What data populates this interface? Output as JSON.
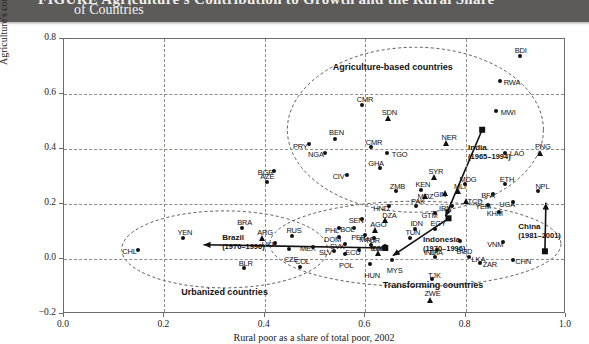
{
  "header": {
    "title_cut": "FIGURE  Agriculture's Contribution to Growth and the Rural Share",
    "title_line2": "of Countries"
  },
  "chart_data": {
    "type": "scatter",
    "title": "Agriculture's Contribution to Growth and the Rural Share of Countries",
    "xlabel": "Rural poor as a share of total poor, 2002",
    "ylabel": "Agriculture's contribution to growth, 1990–2005",
    "xlim": [
      0.0,
      1.0
    ],
    "ylim": [
      -0.2,
      0.8
    ],
    "xticks": [
      "0.0",
      "0.2",
      "0.4",
      "0.6",
      "0.8",
      "1.0"
    ],
    "ytick_values": [
      0.8,
      0.6,
      0.4,
      0.2,
      0.0,
      -0.2
    ],
    "yticks": [
      "0.8",
      "0.6",
      "0.4",
      "0.2",
      "0.0",
      "−0.2"
    ],
    "grid": true,
    "legend": "none",
    "group_labels": [
      {
        "text": "Agriculture-based countries",
        "x": 0.655,
        "y": 0.7
      },
      {
        "text": "Transforming countries",
        "x": 0.735,
        "y": -0.095
      },
      {
        "text": "Urbanized countries",
        "x": 0.32,
        "y": -0.12
      }
    ],
    "ellipses": [
      {
        "name": "agriculture-based-ellipse",
        "cx": 0.7,
        "cy": 0.47,
        "rx": 0.255,
        "ry": 0.3,
        "rot": 0
      },
      {
        "name": "transforming-ellipse",
        "cx": 0.7,
        "cy": 0.055,
        "rx": 0.29,
        "ry": 0.155,
        "rot": 0
      },
      {
        "name": "urbanized-ellipse",
        "cx": 0.32,
        "cy": 0.035,
        "rx": 0.205,
        "ry": 0.14,
        "rot": 0
      }
    ],
    "trajectories": [
      {
        "name": "India",
        "period": "(1965–1994)",
        "label_x": 0.805,
        "label_y": 0.405,
        "from": {
          "x": 0.76,
          "y": 0.155
        },
        "to": {
          "x": 0.833,
          "y": 0.47
        }
      },
      {
        "name": "Indonesia",
        "period": "(1970–1996)",
        "label_x": 0.715,
        "label_y": 0.07,
        "from": {
          "x": 0.655,
          "y": 0.012
        },
        "to": {
          "x": 0.766,
          "y": 0.148
        }
      },
      {
        "name": "China",
        "period": "(1981–2001)",
        "label_x": 0.905,
        "label_y": 0.115,
        "from": {
          "x": 0.96,
          "y": 0.205
        },
        "to": {
          "x": 0.958,
          "y": 0.028
        }
      },
      {
        "name": "Brazil",
        "period": "(1970–1996)",
        "label_x": 0.315,
        "label_y": 0.075,
        "from": {
          "x": 0.278,
          "y": 0.052
        },
        "to": {
          "x": 0.64,
          "y": 0.04
        }
      }
    ],
    "points": [
      {
        "code": "BDI",
        "x": 0.91,
        "y": 0.735,
        "marker": "circle",
        "lx": -6,
        "ly": -11
      },
      {
        "code": "RWA",
        "x": 0.87,
        "y": 0.645,
        "marker": "circle",
        "lx": 3,
        "ly": -4
      },
      {
        "code": "MWI",
        "x": 0.862,
        "y": 0.535,
        "marker": "circle",
        "lx": 4,
        "ly": -4
      },
      {
        "code": "SDN",
        "x": 0.645,
        "y": 0.51,
        "marker": "triangle",
        "lx": -6,
        "ly": -11
      },
      {
        "code": "CMR",
        "x": 0.595,
        "y": 0.56,
        "marker": "circle",
        "lx": -6,
        "ly": -10
      },
      {
        "code": "NER",
        "x": 0.76,
        "y": 0.42,
        "marker": "triangle",
        "lx": -4,
        "ly": -11
      },
      {
        "code": "PNG",
        "x": 0.948,
        "y": 0.385,
        "marker": "triangle",
        "lx": -5,
        "ly": -11
      },
      {
        "code": "LAO",
        "x": 0.88,
        "y": 0.385,
        "marker": "circle",
        "lx": 4,
        "ly": -4
      },
      {
        "code": "BEN",
        "x": 0.54,
        "y": 0.435,
        "marker": "circle",
        "lx": -6,
        "ly": -11
      },
      {
        "code": "PRY",
        "x": 0.49,
        "y": 0.415,
        "marker": "circle",
        "lx": -17,
        "ly": -3
      },
      {
        "code": "NGA",
        "x": 0.52,
        "y": 0.385,
        "marker": "circle",
        "lx": -17,
        "ly": -3
      },
      {
        "code": "CMR2",
        "code_label": "CMR",
        "x": 0.613,
        "y": 0.405,
        "marker": "circle",
        "lx": -6,
        "ly": -10
      },
      {
        "code": "TGO",
        "x": 0.645,
        "y": 0.385,
        "marker": "circle",
        "lx": 4,
        "ly": -3
      },
      {
        "code": "GHA",
        "x": 0.63,
        "y": 0.33,
        "marker": "circle",
        "lx": -12,
        "ly": -9
      },
      {
        "code": "CIV",
        "x": 0.565,
        "y": 0.305,
        "marker": "circle",
        "lx": -15,
        "ly": -3
      },
      {
        "code": "BGR",
        "x": 0.42,
        "y": 0.32,
        "marker": "circle",
        "lx": -17,
        "ly": -3
      },
      {
        "code": "AZE",
        "x": 0.405,
        "y": 0.28,
        "marker": "circle",
        "lx": -7,
        "ly": -10
      },
      {
        "code": "SYR",
        "x": 0.738,
        "y": 0.295,
        "marker": "triangle",
        "lx": -6,
        "ly": -11
      },
      {
        "code": "MDG",
        "x": 0.8,
        "y": 0.27,
        "marker": "circle",
        "lx": -6,
        "ly": -10
      },
      {
        "code": "ETH",
        "x": 0.88,
        "y": 0.27,
        "marker": "circle",
        "lx": -6,
        "ly": -10
      },
      {
        "code": "MLI",
        "x": 0.785,
        "y": 0.245,
        "marker": "triangle",
        "lx": -4,
        "ly": -10
      },
      {
        "code": "GIN",
        "x": 0.758,
        "y": 0.24,
        "marker": "triangle",
        "lx": -11,
        "ly": -3
      },
      {
        "code": "KEN",
        "x": 0.712,
        "y": 0.25,
        "marker": "circle",
        "lx": -6,
        "ly": -10
      },
      {
        "code": "ZMB",
        "x": 0.663,
        "y": 0.245,
        "marker": "circle",
        "lx": -7,
        "ly": -10
      },
      {
        "code": "MOZ",
        "x": 0.72,
        "y": 0.228,
        "marker": "triangle",
        "lx": -8,
        "ly": -4
      },
      {
        "code": "BFA",
        "x": 0.855,
        "y": 0.235,
        "marker": "circle",
        "lx": -12,
        "ly": -3
      },
      {
        "code": "NPL",
        "x": 0.945,
        "y": 0.245,
        "marker": "circle",
        "lx": -3,
        "ly": -10
      },
      {
        "code": "UGA",
        "x": 0.895,
        "y": 0.205,
        "marker": "circle",
        "lx": -14,
        "ly": -3
      },
      {
        "code": "TCD",
        "x": 0.8,
        "y": 0.21,
        "marker": "triangle",
        "lx": 2,
        "ly": -4
      },
      {
        "code": "YEM",
        "x": 0.845,
        "y": 0.195,
        "marker": "circle",
        "lx": -13,
        "ly": -3
      },
      {
        "code": "IRN",
        "x": 0.773,
        "y": 0.19,
        "marker": "circle",
        "lx": -13,
        "ly": -3
      },
      {
        "code": "PAK",
        "x": 0.703,
        "y": 0.19,
        "marker": "circle",
        "lx": -6,
        "ly": -10
      },
      {
        "code": "HND",
        "x": 0.648,
        "y": 0.19,
        "marker": "circle",
        "lx": -16,
        "ly": -3
      },
      {
        "code": "GTM",
        "x": 0.74,
        "y": 0.165,
        "marker": "circle",
        "lx": -14,
        "ly": -3
      },
      {
        "code": "KHM",
        "x": 0.868,
        "y": 0.17,
        "marker": "circle",
        "lx": -13,
        "ly": -3
      },
      {
        "code": "DZA",
        "x": 0.64,
        "y": 0.14,
        "marker": "triangle",
        "lx": -3,
        "ly": -10
      },
      {
        "code": "SEN",
        "x": 0.595,
        "y": 0.145,
        "marker": "circle",
        "lx": -14,
        "ly": -3
      },
      {
        "code": "AGO",
        "x": 0.62,
        "y": 0.105,
        "marker": "triangle",
        "lx": -5,
        "ly": -10
      },
      {
        "code": "IDN",
        "x": 0.7,
        "y": 0.108,
        "marker": "circle",
        "lx": -5,
        "ly": -10
      },
      {
        "code": "EGY",
        "x": 0.74,
        "y": 0.108,
        "marker": "circle",
        "lx": -5,
        "ly": -10
      },
      {
        "code": "MAR",
        "x": 0.618,
        "y": 0.075,
        "marker": "circle",
        "lx": -15,
        "ly": -3
      },
      {
        "code": "TUN",
        "x": 0.69,
        "y": 0.075,
        "marker": "circle",
        "lx": -5,
        "ly": -10
      },
      {
        "code": "ROM",
        "x": 0.64,
        "y": 0.045,
        "marker": "circle",
        "lx": -15,
        "ly": -3
      },
      {
        "code": "BGD",
        "x": 0.79,
        "y": 0.065,
        "marker": "circle",
        "lx": -4,
        "ly": 6
      },
      {
        "code": "VNM",
        "x": 0.875,
        "y": 0.06,
        "marker": "circle",
        "lx": -16,
        "ly": -3
      },
      {
        "code": "IND",
        "x": 0.745,
        "y": 0.03,
        "marker": "circle",
        "lx": -14,
        "ly": -3
      },
      {
        "code": "THA",
        "x": 0.74,
        "y": 0.005,
        "marker": "circle",
        "lx": -7,
        "ly": -10
      },
      {
        "code": "LKA",
        "x": 0.808,
        "y": 0.005,
        "marker": "circle",
        "lx": 2,
        "ly": -3
      },
      {
        "code": "ZAR",
        "x": 0.83,
        "y": -0.015,
        "marker": "circle",
        "lx": 2,
        "ly": -3
      },
      {
        "code": "CHN",
        "x": 0.895,
        "y": -0.005,
        "marker": "circle",
        "lx": 2,
        "ly": -3
      },
      {
        "code": "TJK",
        "x": 0.735,
        "y": -0.075,
        "marker": "circle",
        "lx": -5,
        "ly": -9
      },
      {
        "code": "ZWE",
        "x": 0.73,
        "y": -0.15,
        "marker": "triangle",
        "lx": -6,
        "ly": -11
      },
      {
        "code": "PHL",
        "x": 0.548,
        "y": 0.11,
        "marker": "circle",
        "lx": -14,
        "ly": -3
      },
      {
        "code": "BOL",
        "x": 0.578,
        "y": 0.112,
        "marker": "circle",
        "lx": -14,
        "ly": -3
      },
      {
        "code": "PER",
        "x": 0.6,
        "y": 0.085,
        "marker": "circle",
        "lx": -14,
        "ly": -3
      },
      {
        "code": "DOM",
        "x": 0.548,
        "y": 0.078,
        "marker": "circle",
        "lx": -15,
        "ly": -3
      },
      {
        "code": "SVK",
        "x": 0.56,
        "y": 0.052,
        "marker": "circle",
        "lx": -15,
        "ly": -3
      },
      {
        "code": "RUS",
        "x": 0.455,
        "y": 0.083,
        "marker": "circle",
        "lx": -6,
        "ly": -10
      },
      {
        "code": "UKR",
        "x": 0.422,
        "y": 0.058,
        "marker": "circle",
        "lx": -14,
        "ly": -3
      },
      {
        "code": "CZE",
        "x": 0.45,
        "y": 0.035,
        "marker": "circle",
        "lx": -6,
        "ly": 6
      },
      {
        "code": "MEX",
        "x": 0.498,
        "y": 0.042,
        "marker": "circle",
        "lx": -14,
        "ly": -3
      },
      {
        "code": "SLV",
        "x": 0.538,
        "y": 0.028,
        "marker": "circle",
        "lx": -15,
        "ly": -3
      },
      {
        "code": "POL",
        "x": 0.56,
        "y": 0.015,
        "marker": "circle",
        "lx": -6,
        "ly": 6
      },
      {
        "code": "ECU",
        "x": 0.588,
        "y": 0.03,
        "marker": "circle",
        "lx": -14,
        "ly": -3
      },
      {
        "code": "TUR",
        "x": 0.612,
        "y": 0.048,
        "marker": "circle",
        "lx": -6,
        "ly": -10
      },
      {
        "code": "ZAF",
        "x": 0.625,
        "y": 0.02,
        "marker": "triangle",
        "lx": -6,
        "ly": -10
      },
      {
        "code": "MYS",
        "x": 0.655,
        "y": -0.005,
        "marker": "circle",
        "lx": -6,
        "ly": 6
      },
      {
        "code": "HUN",
        "x": 0.61,
        "y": -0.02,
        "marker": "circle",
        "lx": -6,
        "ly": 6
      },
      {
        "code": "COL",
        "x": 0.472,
        "y": -0.03,
        "marker": "circle",
        "lx": -6,
        "ly": -10
      },
      {
        "code": "BRA",
        "x": 0.355,
        "y": 0.112,
        "marker": "circle",
        "lx": -5,
        "ly": -10
      },
      {
        "code": "ARG",
        "x": 0.395,
        "y": 0.073,
        "marker": "triangle",
        "lx": -5,
        "ly": -11
      },
      {
        "code": "BLR",
        "x": 0.36,
        "y": -0.035,
        "marker": "circle",
        "lx": -6,
        "ly": -10
      },
      {
        "code": "YEN",
        "x": 0.238,
        "y": 0.075,
        "marker": "circle",
        "lx": -6,
        "ly": -10
      },
      {
        "code": "CHL",
        "x": 0.148,
        "y": 0.032,
        "marker": "circle",
        "lx": -16,
        "ly": -3
      }
    ]
  }
}
